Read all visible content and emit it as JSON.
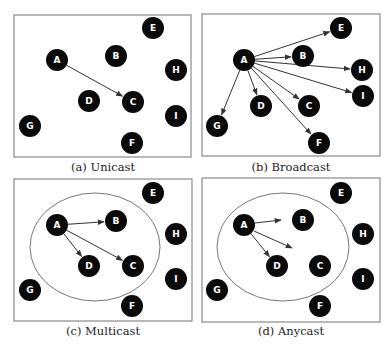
{
  "node_style": {
    "fill": "#0a0a0a",
    "label_color": "#ffffff",
    "radius": 11
  },
  "frame_color": "#8a8a8a",
  "edge_color": "#333333",
  "panels": [
    {
      "id": "a",
      "caption": "(a) Unicast",
      "frame": {
        "x": 14,
        "y": 15,
        "w": 177,
        "h": 142
      },
      "caption_pos": {
        "x": 8,
        "y": 160
      },
      "nodes": [
        {
          "label": "E",
          "x": 153,
          "y": 28
        },
        {
          "label": "A",
          "x": 57,
          "y": 60
        },
        {
          "label": "B",
          "x": 116,
          "y": 56
        },
        {
          "label": "H",
          "x": 176,
          "y": 70
        },
        {
          "label": "D",
          "x": 89,
          "y": 101
        },
        {
          "label": "C",
          "x": 133,
          "y": 102
        },
        {
          "label": "I",
          "x": 176,
          "y": 116
        },
        {
          "label": "G",
          "x": 30,
          "y": 126
        },
        {
          "label": "F",
          "x": 132,
          "y": 143
        }
      ],
      "edges": [
        {
          "from": "A",
          "to": "C"
        }
      ],
      "free_arrows": [],
      "ellipse": null
    },
    {
      "id": "b",
      "caption": "(b) Broadcast",
      "frame": {
        "x": 202,
        "y": 14,
        "w": 178,
        "h": 142
      },
      "caption_pos": {
        "x": 196,
        "y": 160
      },
      "nodes": [
        {
          "label": "E",
          "x": 341,
          "y": 28
        },
        {
          "label": "A",
          "x": 244,
          "y": 60
        },
        {
          "label": "B",
          "x": 303,
          "y": 56
        },
        {
          "label": "H",
          "x": 362,
          "y": 70
        },
        {
          "label": "I",
          "x": 363,
          "y": 96
        },
        {
          "label": "D",
          "x": 261,
          "y": 106
        },
        {
          "label": "C",
          "x": 309,
          "y": 106
        },
        {
          "label": "G",
          "x": 217,
          "y": 126
        },
        {
          "label": "F",
          "x": 319,
          "y": 143
        }
      ],
      "edges": [
        {
          "from": "A",
          "to": "E"
        },
        {
          "from": "A",
          "to": "B"
        },
        {
          "from": "A",
          "to": "H"
        },
        {
          "from": "A",
          "to": "I"
        },
        {
          "from": "A",
          "to": "C"
        },
        {
          "from": "A",
          "to": "D"
        },
        {
          "from": "A",
          "to": "F"
        },
        {
          "from": "A",
          "to": "G"
        }
      ],
      "free_arrows": [],
      "ellipse": null
    },
    {
      "id": "c",
      "caption": "(c) Multicast",
      "frame": {
        "x": 14,
        "y": 179,
        "w": 178,
        "h": 142
      },
      "caption_pos": {
        "x": 8,
        "y": 324
      },
      "nodes": [
        {
          "label": "E",
          "x": 153,
          "y": 193
        },
        {
          "label": "A",
          "x": 57,
          "y": 225
        },
        {
          "label": "B",
          "x": 116,
          "y": 221
        },
        {
          "label": "H",
          "x": 176,
          "y": 234
        },
        {
          "label": "D",
          "x": 89,
          "y": 266
        },
        {
          "label": "C",
          "x": 133,
          "y": 266
        },
        {
          "label": "I",
          "x": 176,
          "y": 279
        },
        {
          "label": "G",
          "x": 30,
          "y": 290
        },
        {
          "label": "F",
          "x": 132,
          "y": 306
        }
      ],
      "edges": [
        {
          "from": "A",
          "to": "B"
        },
        {
          "from": "A",
          "to": "D"
        },
        {
          "from": "A",
          "to": "C"
        }
      ],
      "free_arrows": [],
      "ellipse": {
        "cx": 95,
        "cy": 247,
        "rx": 65,
        "ry": 54
      }
    },
    {
      "id": "d",
      "caption": "(d) Anycast",
      "frame": {
        "x": 202,
        "y": 178,
        "w": 178,
        "h": 144
      },
      "caption_pos": {
        "x": 196,
        "y": 324
      },
      "nodes": [
        {
          "label": "E",
          "x": 341,
          "y": 193
        },
        {
          "label": "A",
          "x": 244,
          "y": 225
        },
        {
          "label": "B",
          "x": 303,
          "y": 220
        },
        {
          "label": "H",
          "x": 363,
          "y": 234
        },
        {
          "label": "D",
          "x": 277,
          "y": 266
        },
        {
          "label": "C",
          "x": 320,
          "y": 266
        },
        {
          "label": "I",
          "x": 363,
          "y": 279
        },
        {
          "label": "G",
          "x": 217,
          "y": 290
        },
        {
          "label": "F",
          "x": 320,
          "y": 306
        }
      ],
      "edges": [
        {
          "from": "A",
          "to": "D"
        }
      ],
      "free_arrows": [
        {
          "x1": 255,
          "y1": 223,
          "x2": 281,
          "y2": 220
        },
        {
          "x1": 254,
          "y1": 231,
          "x2": 292,
          "y2": 248
        }
      ],
      "ellipse": {
        "cx": 283,
        "cy": 247,
        "rx": 66,
        "ry": 54
      }
    }
  ]
}
